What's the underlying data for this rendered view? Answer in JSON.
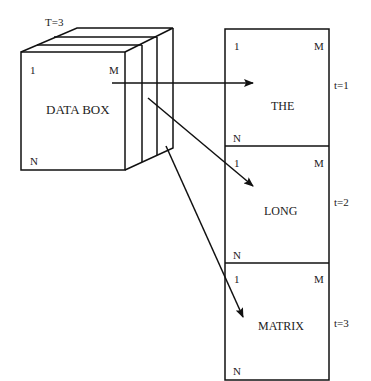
{
  "cube": {
    "top_label": "T=3",
    "corner_1": "1",
    "corner_m": "M",
    "corner_n": "N",
    "title": "DATA BOX"
  },
  "slices": [
    {
      "word": "THE",
      "t_label": "t=1",
      "corner_1": "1",
      "corner_m": "M",
      "corner_n": "N"
    },
    {
      "word": "LONG",
      "t_label": "t=2",
      "corner_1": "1",
      "corner_m": "M",
      "corner_n": "N"
    },
    {
      "word": "MATRIX",
      "t_label": "t=3",
      "corner_1": "1",
      "corner_m": "M",
      "corner_n": "N"
    }
  ]
}
